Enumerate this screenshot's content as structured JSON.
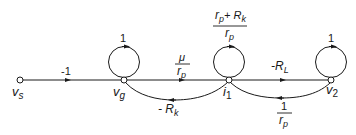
{
  "diagram": {
    "type": "signal-flow-graph",
    "nodes": [
      {
        "id": "vs",
        "label": "v",
        "sub": "s"
      },
      {
        "id": "vg",
        "label": "v",
        "sub": "g"
      },
      {
        "id": "i1",
        "label": "i",
        "sub": "1"
      },
      {
        "id": "v2",
        "label": "v",
        "sub": "2"
      }
    ],
    "edges": {
      "vs_vg": {
        "gain": "-1"
      },
      "vg_self": {
        "gain": "1"
      },
      "vg_i1": {
        "num": "μ",
        "den_main": "r",
        "den_sub": "p"
      },
      "i1_self": {
        "num_main": "r",
        "num_sub": "p",
        "num_plus": "+ R",
        "num_sub2": "k",
        "den_main": "r",
        "den_sub": "p"
      },
      "i1_vg": {
        "main": "- R",
        "sub": "k"
      },
      "i1_v2": {
        "main": "-R",
        "sub": "L"
      },
      "v2_self": {
        "gain": "1"
      },
      "v2_i1": {
        "num": "1",
        "den_main": "r",
        "den_sub": "p"
      }
    },
    "colors": {
      "stroke": "#1a1a1a",
      "background": "#ffffff"
    }
  }
}
